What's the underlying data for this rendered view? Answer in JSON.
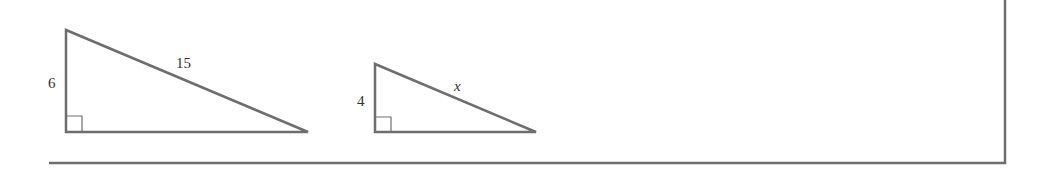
{
  "figure": {
    "triangle_1": {
      "leg_label": "6",
      "hypotenuse_label": "15"
    },
    "triangle_2": {
      "leg_label": "4",
      "hypotenuse_label": "x"
    },
    "colors": {
      "stroke": "#6e6e6e",
      "text": "#333333"
    }
  }
}
